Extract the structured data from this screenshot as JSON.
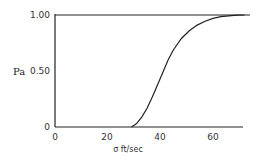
{
  "chart_data": {
    "type": "line",
    "title": "",
    "xlabel": "σ ft/sec",
    "ylabel": "Pa",
    "xlim": [
      0,
      72
    ],
    "ylim": [
      0,
      1.0
    ],
    "x_ticks": [
      "0",
      "20",
      "40",
      "60"
    ],
    "y_ticks": [
      "0",
      "0.50",
      "1.00"
    ],
    "grid": false,
    "legend": null,
    "series": [
      {
        "name": "Pa",
        "x": [
          0,
          29,
          31,
          33,
          35,
          37,
          39,
          41,
          43,
          45,
          48,
          51,
          54,
          57,
          60,
          63,
          66,
          69,
          72
        ],
        "y": [
          0,
          0,
          0.03,
          0.09,
          0.17,
          0.27,
          0.38,
          0.49,
          0.6,
          0.69,
          0.79,
          0.86,
          0.91,
          0.945,
          0.97,
          0.985,
          0.993,
          0.998,
          1.0
        ]
      }
    ]
  },
  "labels": {
    "ylabel": "Pa",
    "xlabel": "σ ft/sec",
    "y_tick_0": "0",
    "y_tick_050": "0.50",
    "y_tick_100": "1.00",
    "x_tick_0": "0",
    "x_tick_20": "20",
    "x_tick_40": "40",
    "x_tick_60": "60"
  }
}
